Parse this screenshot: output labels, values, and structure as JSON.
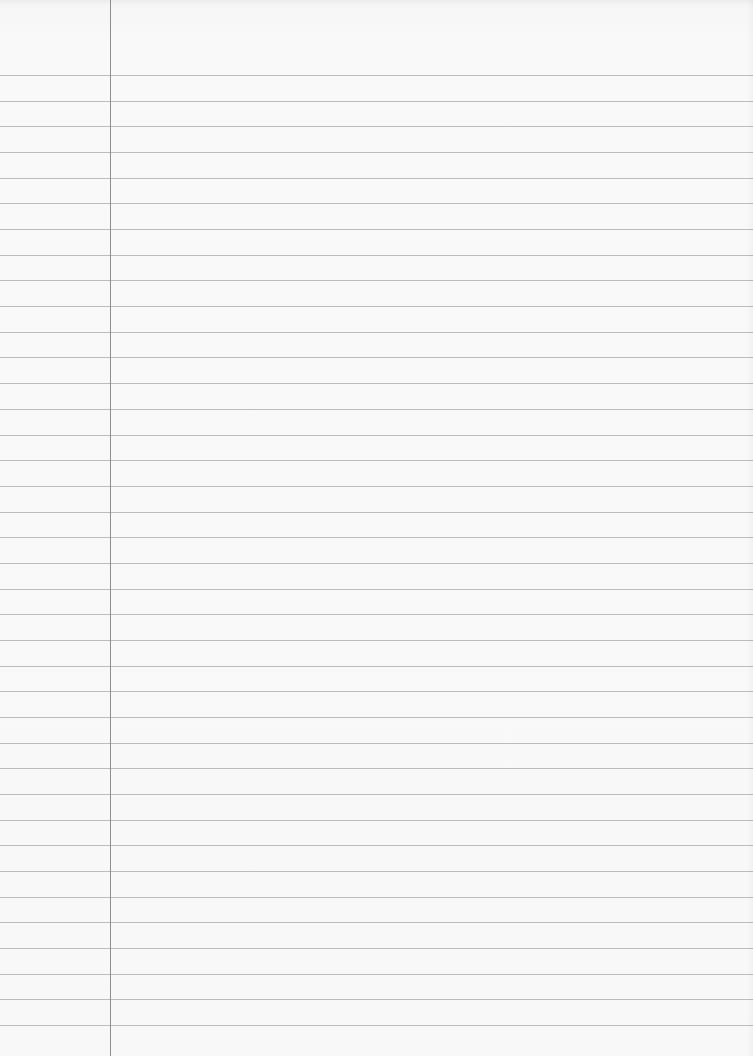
{
  "paper": {
    "type": "lined-notebook-page",
    "background_color": "#f8f8f8",
    "rule_color": "#bcbcbc",
    "margin_color": "#8e8e8e",
    "margin_x": 110,
    "first_rule_y": 75,
    "rule_spacing": 25.68,
    "rule_count": 38,
    "text": ""
  }
}
